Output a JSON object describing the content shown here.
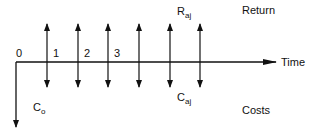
{
  "diagram": {
    "type": "cash-flow-timeline",
    "axis": {
      "label": "Time",
      "origin_label": "0",
      "initial_cost": {
        "base": "C",
        "sub": "o"
      }
    },
    "period_labels": [
      "1",
      "2",
      "3"
    ],
    "flow_count": 6,
    "return_flow_label": {
      "base": "R",
      "sub": "aj"
    },
    "cost_flow_label": {
      "base": "C",
      "sub": "aj"
    },
    "legend": {
      "top": "Return",
      "bottom": "Costs"
    },
    "colors": {
      "ink": "#111111",
      "background": "#ffffff"
    }
  }
}
